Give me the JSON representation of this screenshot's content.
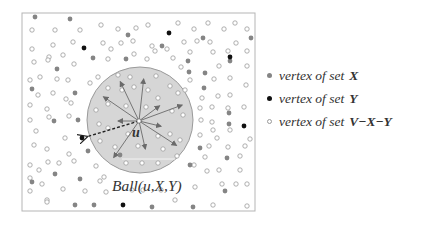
{
  "diagram": {
    "box": {
      "x": 22,
      "y": 13,
      "w": 233,
      "h": 198
    },
    "ball": {
      "cx": 140,
      "cy": 120,
      "r": 53,
      "fill": "#d6d6d6",
      "stroke": "#9a9a9a"
    },
    "center": {
      "x": 139,
      "y": 121,
      "label": "u"
    },
    "ball_label": "Ball(u,X,Y)",
    "colors": {
      "X": "#858585",
      "Y": "#111111",
      "other_stroke": "#9a9a9a",
      "arrow": "#6a6a6a"
    },
    "arrows_to_X": [
      {
        "x": 119,
        "y": 79
      },
      {
        "x": 144,
        "y": 76
      },
      {
        "x": 101,
        "y": 95
      },
      {
        "x": 162,
        "y": 104
      },
      {
        "x": 185,
        "y": 104
      },
      {
        "x": 115,
        "y": 121
      },
      {
        "x": 164,
        "y": 127
      },
      {
        "x": 179,
        "y": 147
      },
      {
        "x": 146,
        "y": 152
      },
      {
        "x": 112,
        "y": 160
      }
    ],
    "dashed_arrow_to_Y": {
      "x": 82,
      "y": 138
    },
    "vertices_X": [
      [
        35,
        17
      ],
      [
        70,
        19
      ],
      [
        128,
        35
      ],
      [
        203,
        38
      ],
      [
        251,
        38
      ],
      [
        162,
        46
      ],
      [
        93,
        58
      ],
      [
        126,
        59
      ],
      [
        188,
        61
      ],
      [
        57,
        69
      ],
      [
        230,
        61
      ],
      [
        189,
        72
      ],
      [
        205,
        73
      ],
      [
        32,
        89
      ],
      [
        75,
        93
      ],
      [
        204,
        88
      ],
      [
        54,
        121
      ],
      [
        78,
        120
      ],
      [
        229,
        124
      ],
      [
        88,
        151
      ],
      [
        190,
        165
      ],
      [
        227,
        158
      ],
      [
        55,
        174
      ],
      [
        80,
        179
      ],
      [
        225,
        191
      ],
      [
        75,
        205
      ],
      [
        94,
        205
      ],
      [
        152,
        207
      ],
      [
        193,
        207
      ],
      [
        32,
        182
      ],
      [
        200,
        148
      ],
      [
        120,
        155
      ],
      [
        229,
        113
      ]
    ],
    "vertices_Y": [
      [
        84,
        48
      ],
      [
        169,
        33
      ],
      [
        230,
        57
      ],
      [
        244,
        126
      ],
      [
        82,
        138
      ],
      [
        123,
        205
      ]
    ],
    "vertices_other": [
      [
        32,
        30
      ],
      [
        55,
        30
      ],
      [
        80,
        30
      ],
      [
        101,
        25
      ],
      [
        118,
        29
      ],
      [
        136,
        28
      ],
      [
        148,
        25
      ],
      [
        178,
        23
      ],
      [
        194,
        29
      ],
      [
        208,
        23
      ],
      [
        224,
        29
      ],
      [
        235,
        23
      ],
      [
        247,
        29
      ],
      [
        53,
        45
      ],
      [
        73,
        42
      ],
      [
        103,
        43
      ],
      [
        121,
        43
      ],
      [
        133,
        41
      ],
      [
        152,
        46
      ],
      [
        167,
        49
      ],
      [
        184,
        42
      ],
      [
        197,
        41
      ],
      [
        210,
        42
      ],
      [
        236,
        43
      ],
      [
        32,
        49
      ],
      [
        49,
        57
      ],
      [
        63,
        55
      ],
      [
        74,
        64
      ],
      [
        108,
        59
      ],
      [
        134,
        54
      ],
      [
        155,
        51
      ],
      [
        173,
        58
      ],
      [
        190,
        52
      ],
      [
        213,
        52
      ],
      [
        228,
        51
      ],
      [
        247,
        51
      ],
      [
        34,
        62
      ],
      [
        48,
        60
      ],
      [
        111,
        49
      ],
      [
        147,
        59
      ],
      [
        181,
        67
      ],
      [
        219,
        66
      ],
      [
        247,
        66
      ],
      [
        30,
        80
      ],
      [
        40,
        77
      ],
      [
        57,
        79
      ],
      [
        68,
        80
      ],
      [
        90,
        83
      ],
      [
        98,
        77
      ],
      [
        190,
        80
      ],
      [
        214,
        79
      ],
      [
        230,
        78
      ],
      [
        246,
        85
      ],
      [
        38,
        95
      ],
      [
        53,
        93
      ],
      [
        66,
        99
      ],
      [
        185,
        90
      ],
      [
        202,
        98
      ],
      [
        218,
        96
      ],
      [
        230,
        95
      ],
      [
        30,
        105
      ],
      [
        47,
        109
      ],
      [
        71,
        103
      ],
      [
        200,
        108
      ],
      [
        212,
        107
      ],
      [
        228,
        108
      ],
      [
        244,
        107
      ],
      [
        30,
        120
      ],
      [
        49,
        117
      ],
      [
        69,
        116
      ],
      [
        201,
        120
      ],
      [
        212,
        122
      ],
      [
        213,
        130
      ],
      [
        230,
        130
      ],
      [
        36,
        131
      ],
      [
        65,
        138
      ],
      [
        200,
        135
      ],
      [
        217,
        138
      ],
      [
        250,
        139
      ],
      [
        34,
        145
      ],
      [
        47,
        149
      ],
      [
        69,
        154
      ],
      [
        209,
        146
      ],
      [
        228,
        147
      ],
      [
        245,
        146
      ],
      [
        30,
        165
      ],
      [
        39,
        170
      ],
      [
        48,
        162
      ],
      [
        59,
        163
      ],
      [
        74,
        161
      ],
      [
        96,
        166
      ],
      [
        100,
        181
      ],
      [
        205,
        157
      ],
      [
        240,
        156
      ],
      [
        30,
        178
      ],
      [
        42,
        184
      ],
      [
        63,
        189
      ],
      [
        85,
        191
      ],
      [
        106,
        192
      ],
      [
        194,
        165
      ],
      [
        207,
        171
      ],
      [
        219,
        170
      ],
      [
        240,
        170
      ],
      [
        30,
        191
      ],
      [
        47,
        200
      ],
      [
        104,
        177
      ],
      [
        195,
        187
      ],
      [
        222,
        184
      ],
      [
        236,
        184
      ],
      [
        247,
        184
      ],
      [
        47,
        202
      ],
      [
        213,
        205
      ],
      [
        247,
        206
      ],
      [
        175,
        200
      ],
      [
        161,
        190
      ],
      [
        132,
        190
      ],
      [
        143,
        190
      ],
      [
        118,
        75
      ],
      [
        130,
        77
      ],
      [
        156,
        76
      ],
      [
        108,
        88
      ],
      [
        134,
        87
      ],
      [
        122,
        90
      ],
      [
        148,
        90
      ],
      [
        170,
        86
      ],
      [
        158,
        98
      ],
      [
        178,
        93
      ],
      [
        96,
        110
      ],
      [
        108,
        104
      ],
      [
        126,
        106
      ],
      [
        146,
        107
      ],
      [
        172,
        111
      ],
      [
        183,
        115
      ],
      [
        99,
        124
      ],
      [
        108,
        128
      ],
      [
        128,
        134
      ],
      [
        158,
        136
      ],
      [
        170,
        134
      ],
      [
        180,
        140
      ],
      [
        100,
        141
      ],
      [
        115,
        147
      ],
      [
        138,
        146
      ],
      [
        163,
        149
      ],
      [
        177,
        156
      ],
      [
        126,
        163
      ],
      [
        142,
        163
      ],
      [
        158,
        163
      ]
    ]
  },
  "legend": {
    "items": [
      {
        "prefix": "vertex of set",
        "set": "X",
        "kind": "X"
      },
      {
        "prefix": "vertex of set",
        "set": "Y",
        "kind": "Y"
      },
      {
        "prefix": "vertex of set",
        "set": "V−X−Y",
        "kind": "other"
      }
    ]
  }
}
